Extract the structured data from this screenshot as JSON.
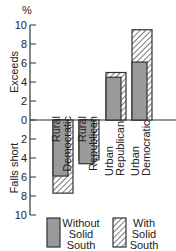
{
  "chart_data": {
    "type": "bar",
    "title": "",
    "xlabel": "",
    "ylabel_unit": "%",
    "ylabel_top": "Exceeds",
    "ylabel_bottom": "Falls short",
    "yticks_top": [
      "0",
      "2",
      "4",
      "6",
      "8",
      "10"
    ],
    "yticks_bottom": [
      "2",
      "4",
      "6",
      "8",
      "10"
    ],
    "ylim": [
      -10,
      10
    ],
    "grid": false,
    "categories": [
      {
        "line1": "Rural",
        "line2": "Democratic"
      },
      {
        "line1": "Rural",
        "line2": "Republican"
      },
      {
        "line1": "Urban",
        "line2": "Republican"
      },
      {
        "line1": "Urban",
        "line2": "Democratic"
      }
    ],
    "series": [
      {
        "name": "Without Solid South",
        "values": [
          -5.9,
          -4.6,
          4.5,
          6.1
        ]
      },
      {
        "name": "With Solid South",
        "values": [
          -7.7,
          -4.2,
          5.0,
          9.5
        ]
      }
    ],
    "legend": {
      "position": "bottom",
      "items": [
        {
          "line1": "Without",
          "line2": "Solid",
          "line3": "South",
          "style": "gray"
        },
        {
          "line1": "With",
          "line2": "Solid",
          "line3": "South",
          "style": "hatched"
        }
      ]
    },
    "colors": {
      "gray": "#9a9a9a",
      "outline": "#333333"
    }
  }
}
